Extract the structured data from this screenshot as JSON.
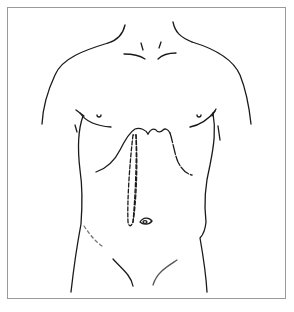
{
  "figure": {
    "type": "anatomical line drawing",
    "caption": "",
    "colors": {
      "line": "#1a1a1a",
      "border": "#9a9a9a",
      "background": "#ffffff"
    },
    "features": [
      "neck-outline",
      "clavicles",
      "shoulders",
      "nipples",
      "costal-margins",
      "xiphoid-notch",
      "dashed-incision-outline",
      "umbilicus",
      "flanks",
      "inguinal-lines"
    ]
  }
}
